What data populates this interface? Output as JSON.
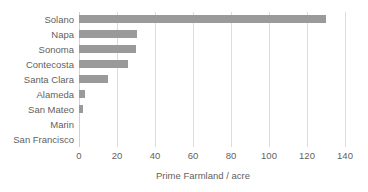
{
  "chart_data": {
    "type": "bar",
    "orientation": "horizontal",
    "title": "",
    "xlabel": "Prime Farmland / acre",
    "ylabel": "",
    "categories": [
      "Solano",
      "Napa",
      "Sonoma",
      "Contecosta",
      "Santa Clara",
      "Alameda",
      "San Mateo",
      "Marin",
      "San Francisco"
    ],
    "values": [
      130,
      30.5,
      30,
      26,
      15,
      3,
      2,
      0,
      0
    ],
    "xlim": [
      0,
      140
    ],
    "xticks": [
      0,
      20,
      40,
      60,
      80,
      100,
      120,
      140
    ],
    "xtick_labels": [
      "0",
      "20",
      "40",
      "60",
      "80",
      "100",
      "120",
      "140"
    ],
    "grid": "vertical",
    "legend": "none",
    "bar_color": "#9a9a9a",
    "grid_color": "#dcdcdc",
    "text_color": "#5f5f5f",
    "background": "#ffffff"
  }
}
